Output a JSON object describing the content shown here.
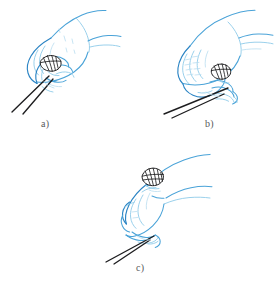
{
  "figure": {
    "background_color": "#ffffff",
    "line_color": "#4aa3d8",
    "line_color_soft": "#8ecbe9",
    "line_color_pale": "#b9ddf0",
    "chopstick_color": "#1d1d1f",
    "caption_color": "#58585a",
    "panels": [
      {
        "id": "a",
        "caption": "a)",
        "subject": "hand-holding-chopsticks",
        "held_object": "round-hatched-object",
        "object_position": "between-chopstick-tips-at-fingers",
        "chopstick_direction": "down-left"
      },
      {
        "id": "b",
        "caption": "b)",
        "subject": "hand-holding-chopsticks",
        "held_object": "round-hatched-object",
        "object_position": "at-fingertips-curled-fingers",
        "chopstick_direction": "down-left"
      },
      {
        "id": "c",
        "caption": "c)",
        "subject": "hand-holding-chopsticks",
        "held_object": "round-hatched-object",
        "object_position": "raised-above-hand",
        "chopstick_direction": "down-left-steep"
      }
    ]
  }
}
